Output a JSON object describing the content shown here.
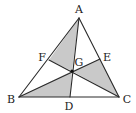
{
  "diagram": {
    "type": "triangle-cevians",
    "colors": {
      "shade": "#c9c9c9",
      "stroke": "#2a2a2a",
      "background": "#ffffff"
    },
    "points": {
      "A": {
        "x": 79,
        "y": 18,
        "label": "A",
        "lx": 79,
        "ly": 13
      },
      "B": {
        "x": 19,
        "y": 97,
        "label": "B",
        "lx": 11,
        "ly": 103
      },
      "C": {
        "x": 119,
        "y": 97,
        "label": "C",
        "lx": 127,
        "ly": 103
      },
      "D": {
        "x": 70,
        "y": 97,
        "label": "D",
        "lx": 69,
        "ly": 110
      },
      "E": {
        "x": 100,
        "y": 59,
        "label": "E",
        "lx": 107,
        "ly": 61
      },
      "F": {
        "x": 49,
        "y": 60,
        "label": "F",
        "lx": 42,
        "ly": 61
      },
      "G": {
        "x": 72,
        "y": 71,
        "label": "G",
        "lx": 79,
        "ly": 66
      }
    },
    "segments": [
      [
        "A",
        "B"
      ],
      [
        "B",
        "C"
      ],
      [
        "C",
        "A"
      ],
      [
        "A",
        "D"
      ],
      [
        "B",
        "E"
      ],
      [
        "C",
        "F"
      ]
    ],
    "shaded_regions": [
      [
        "A",
        "F",
        "G"
      ],
      [
        "B",
        "D",
        "G"
      ],
      [
        "C",
        "E",
        "G"
      ]
    ]
  }
}
